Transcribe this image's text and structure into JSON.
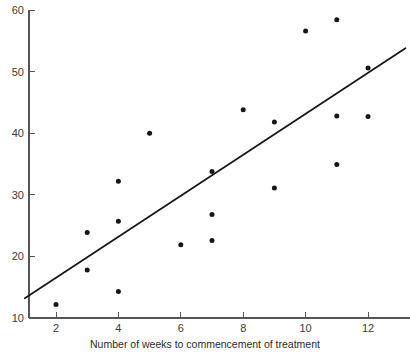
{
  "chart_data": {
    "type": "scatter",
    "title": "",
    "subtitle": "",
    "xlabel": "Number of weeks to commencement of treatment",
    "ylabel": "",
    "xlim": [
      1,
      13.2
    ],
    "ylim": [
      10,
      60
    ],
    "xticks": [
      2,
      4,
      6,
      8,
      10,
      12
    ],
    "xtick_labels": [
      "2",
      "4",
      "6",
      "8",
      "10",
      "12"
    ],
    "yticks": [
      10,
      20,
      30,
      40,
      50,
      60
    ],
    "ytick_labels": [
      "10",
      "20",
      "30",
      "40",
      "50",
      "60"
    ],
    "grid": false,
    "legend": false,
    "legend_position": "none",
    "marker": "filled-circle",
    "marker_color": "#161616",
    "marker_size_px": 4.6,
    "points": [
      {
        "x": 2,
        "y": 12.2
      },
      {
        "x": 3,
        "y": 17.8
      },
      {
        "x": 3,
        "y": 23.9
      },
      {
        "x": 4,
        "y": 14.3
      },
      {
        "x": 4,
        "y": 25.7
      },
      {
        "x": 4,
        "y": 32.2
      },
      {
        "x": 5,
        "y": 40.0
      },
      {
        "x": 6,
        "y": 21.9
      },
      {
        "x": 7,
        "y": 22.6
      },
      {
        "x": 7,
        "y": 26.8
      },
      {
        "x": 7,
        "y": 33.8
      },
      {
        "x": 8,
        "y": 43.8
      },
      {
        "x": 9,
        "y": 31.1
      },
      {
        "x": 9,
        "y": 41.8
      },
      {
        "x": 10,
        "y": 56.6
      },
      {
        "x": 11,
        "y": 34.9
      },
      {
        "x": 11,
        "y": 42.8
      },
      {
        "x": 11,
        "y": 58.4
      },
      {
        "x": 12,
        "y": 42.7
      },
      {
        "x": 12,
        "y": 50.6
      }
    ],
    "fit_line": {
      "type": "linear-regression",
      "color": "#161616",
      "start": {
        "x": 1.0,
        "y": 13.2
      },
      "end": {
        "x": 13.2,
        "y": 53.8
      }
    }
  }
}
